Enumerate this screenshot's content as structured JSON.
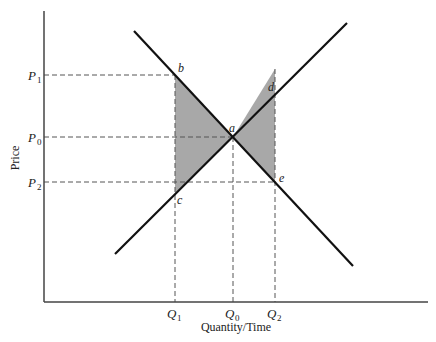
{
  "diagram": {
    "type": "supply-demand",
    "axes": {
      "ylabel": "Price",
      "xlabel": "Quantity/Time"
    },
    "price_ticks": [
      {
        "sym": "P",
        "sub": "1",
        "y": 75
      },
      {
        "sym": "P",
        "sub": "0",
        "y": 137
      },
      {
        "sym": "P",
        "sub": "2",
        "y": 182
      }
    ],
    "quantity_ticks": [
      {
        "sym": "Q",
        "sub": "1",
        "x": 175
      },
      {
        "sym": "Q",
        "sub": "0",
        "x": 233
      },
      {
        "sym": "Q",
        "sub": "2",
        "x": 275
      }
    ],
    "points": {
      "a": "a",
      "b": "b",
      "c": "c",
      "d": "d",
      "e": "e"
    },
    "colors": {
      "line": "#111111",
      "shade": "#a8a8a8",
      "dash": "#555555",
      "axis": "#444444"
    }
  }
}
